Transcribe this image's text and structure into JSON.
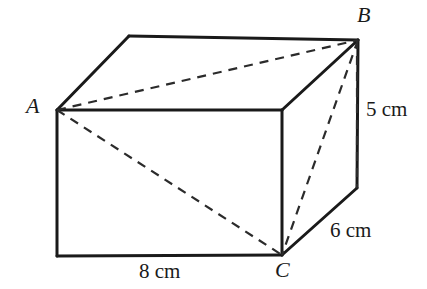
{
  "figure": {
    "name": "cuboid-with-diagonals",
    "background_color": "#ffffff",
    "line_color": "#1a1a1a",
    "dashed_color": "#2b2b2b"
  },
  "vertices": [
    {
      "id": "A",
      "label": "A",
      "x": 57,
      "y": 110,
      "position": "front-top-left"
    },
    {
      "id": "B",
      "label": "B",
      "x": 358,
      "y": 40,
      "position": "back-top-right"
    },
    {
      "id": "C",
      "label": "C",
      "x": 282,
      "y": 255,
      "position": "front-bottom-right"
    }
  ],
  "dimensions": [
    {
      "id": "width",
      "value": "8 cm",
      "edge": "bottom-front"
    },
    {
      "id": "height",
      "value": "5 cm",
      "edge": "right-vertical"
    },
    {
      "id": "depth",
      "value": "6 cm",
      "edge": "bottom-right-depth"
    }
  ],
  "geometry": {
    "front_top_left": {
      "x": 57,
      "y": 110
    },
    "front_top_right": {
      "x": 282,
      "y": 110
    },
    "front_bottom_left": {
      "x": 57,
      "y": 256
    },
    "front_bottom_right": {
      "x": 282,
      "y": 255
    },
    "back_top_left": {
      "x": 129,
      "y": 36
    },
    "back_top_right": {
      "x": 358,
      "y": 40
    },
    "back_bottom_right": {
      "x": 357,
      "y": 188
    }
  }
}
